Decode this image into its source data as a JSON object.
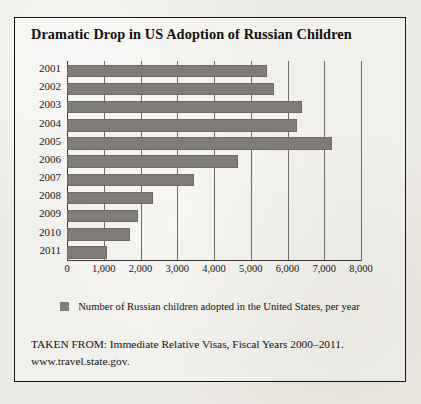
{
  "title": "Dramatic Drop in US Adoption of Russian Children",
  "legend": {
    "label": "Number of Russian children adopted in the United States, per year",
    "swatch_color": "#807d78"
  },
  "source": {
    "line1": "TAKEN FROM: Immediate Relative Visas, Fiscal Years 2000–2011.",
    "line2": "www.travel.state.gov."
  },
  "colors": {
    "bar": "#807d78",
    "frame": "#15130f",
    "grid": "#6f6b64",
    "paper": "#eceae4"
  },
  "chart_data": {
    "type": "bar",
    "orientation": "horizontal",
    "title": "Dramatic Drop in US Adoption of Russian Children",
    "xlabel": "",
    "ylabel": "",
    "xlim": [
      0,
      8000
    ],
    "xticks": [
      0,
      1000,
      2000,
      3000,
      4000,
      5000,
      6000,
      7000,
      8000
    ],
    "xtick_labels": [
      "0",
      "1,000",
      "2,000",
      "3,000",
      "4,000",
      "5,000",
      "6,000",
      "7,000",
      "8,000"
    ],
    "grid": true,
    "legend_position": "bottom",
    "categories": [
      "2001",
      "2002",
      "2003",
      "2004",
      "2005",
      "2006",
      "2007",
      "2008",
      "2009",
      "2010",
      "2011"
    ],
    "series": [
      {
        "name": "Number of Russian children adopted in the United States, per year",
        "values": [
          5440,
          5630,
          6400,
          6260,
          7210,
          4650,
          3460,
          2340,
          1930,
          1710,
          1090
        ]
      }
    ]
  }
}
